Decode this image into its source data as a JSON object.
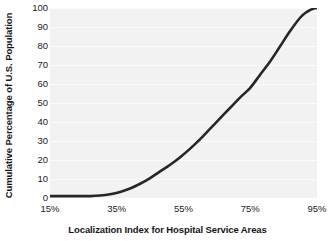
{
  "chart_data": {
    "type": "line",
    "title": "",
    "subtitle": "",
    "xlabel": "Localization Index for Hospital Service Areas",
    "ylabel": "Cumulative Percentage of U.S. Population",
    "xlim": [
      15,
      95
    ],
    "ylim": [
      0,
      100
    ],
    "xtick_labels": [
      "15%",
      "35%",
      "55%",
      "75%",
      "95%"
    ],
    "xticks": [
      15,
      35,
      55,
      75,
      95
    ],
    "ytick_labels": [
      "0",
      "10",
      "20",
      "30",
      "40",
      "50",
      "60",
      "70",
      "80",
      "90",
      "100"
    ],
    "yticks": [
      0,
      10,
      20,
      30,
      40,
      50,
      60,
      70,
      80,
      90,
      100
    ],
    "grid": "horizontal",
    "legend": "none",
    "series": [
      {
        "name": "Cumulative Percentage of U.S. Population",
        "color": "#262626",
        "line_width": 2.6,
        "x": [
          15,
          18,
          21,
          24,
          27,
          30,
          33,
          36,
          39,
          42,
          45,
          48,
          51,
          54,
          57,
          60,
          63,
          66,
          69,
          72,
          75,
          78,
          81,
          84,
          87,
          90,
          92,
          94,
          95
        ],
        "values": [
          1,
          1,
          1,
          1,
          1,
          1.3,
          2,
          3.2,
          5,
          7.5,
          10.5,
          14,
          17.5,
          21.5,
          26,
          31,
          36.5,
          42,
          47.5,
          53,
          58,
          65,
          72,
          80,
          88,
          95,
          98,
          99.7,
          100
        ]
      }
    ],
    "plot_background": "#f2f2f2",
    "gridline_color": "#fbfbfb",
    "text_color": "#1a1a1a"
  }
}
